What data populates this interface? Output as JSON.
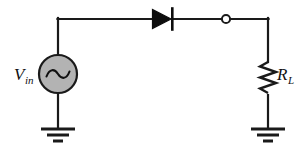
{
  "diagram": {
    "background_color": "#ffffff",
    "wire_color": "#1a1a1a",
    "source_fill_color": "#b3b3b3",
    "node_fill_color": "#ffffff"
  },
  "source": {
    "name": "ac-voltage-source",
    "label_main": "V",
    "label_sub": "in",
    "symbol": "ac-source-sine-icon"
  },
  "diode": {
    "name": "diode",
    "symbol": "diode-icon",
    "label": ""
  },
  "node": {
    "name": "open-terminal-node",
    "symbol": "open-circle-node-icon",
    "label": ""
  },
  "resistor": {
    "name": "load-resistor",
    "label_main": "R",
    "label_sub": "L",
    "symbol": "resistor-zigzag-icon"
  },
  "grounds": [
    {
      "name": "ground-left",
      "symbol": "ground-icon"
    },
    {
      "name": "ground-right",
      "symbol": "ground-icon"
    }
  ],
  "wires": [
    {
      "name": "wire-top",
      "from": "source-top",
      "to": "right-top-corner"
    },
    {
      "name": "wire-left-vertical",
      "from": "top-left-corner",
      "to": "source-top"
    },
    {
      "name": "wire-source-to-ground",
      "from": "source-bottom",
      "to": "ground-left"
    },
    {
      "name": "wire-right-vertical",
      "from": "right-top-corner",
      "to": "ground-right"
    }
  ]
}
